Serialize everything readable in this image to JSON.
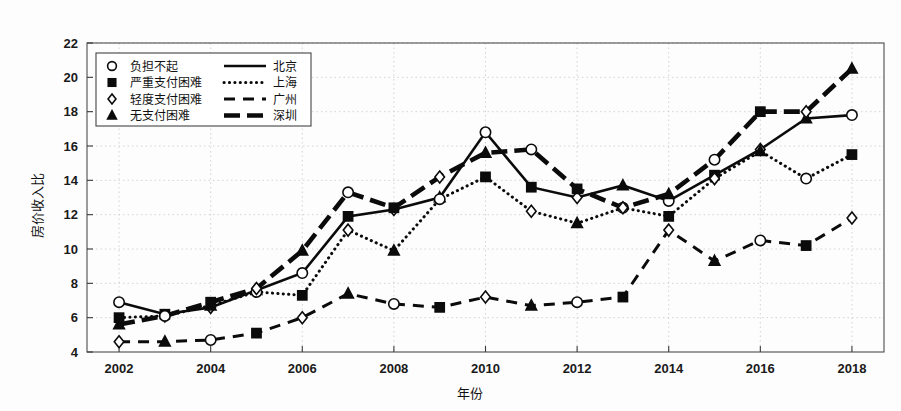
{
  "chart_data": {
    "type": "line",
    "title": "",
    "xlabel": "年份",
    "ylabel": "房价收入比",
    "xlim": [
      2001.3,
      2018.7
    ],
    "ylim": [
      4,
      22
    ],
    "ytick_labels": [
      "4",
      "6",
      "8",
      "10",
      "12",
      "14",
      "16",
      "18",
      "20",
      "22"
    ],
    "yticks": [
      4,
      6,
      8,
      10,
      12,
      14,
      16,
      18,
      20,
      22
    ],
    "xtick_labels": [
      "2002",
      "2004",
      "2006",
      "2008",
      "2010",
      "2012",
      "2014",
      "2016",
      "2018"
    ],
    "xticks": [
      2002,
      2004,
      2006,
      2008,
      2010,
      2012,
      2014,
      2016,
      2018
    ],
    "x": [
      2002,
      2003,
      2004,
      2005,
      2006,
      2007,
      2008,
      2009,
      2010,
      2011,
      2012,
      2013,
      2014,
      2015,
      2016,
      2017,
      2018
    ],
    "grid": true,
    "legend_position": "upper-left",
    "series": [
      {
        "name": "北京",
        "line_style": "solid",
        "color": "#0b0b0b",
        "values": [
          6.9,
          6.2,
          6.6,
          7.6,
          8.6,
          11.9,
          12.3,
          13.0,
          16.8,
          13.6,
          13.0,
          13.7,
          12.8,
          14.3,
          15.8,
          17.6,
          17.8
        ]
      },
      {
        "name": "上海",
        "line_style": "dotted",
        "color": "#0b0b0b",
        "values": [
          6.0,
          6.1,
          6.7,
          7.5,
          7.3,
          11.1,
          9.9,
          12.9,
          14.2,
          12.2,
          11.5,
          12.4,
          11.9,
          14.1,
          15.7,
          14.1,
          15.5
        ]
      },
      {
        "name": "广州",
        "line_style": "dashed",
        "color": "#0b0b0b",
        "values": [
          4.6,
          4.6,
          4.7,
          5.1,
          6.0,
          7.4,
          6.8,
          6.6,
          7.2,
          6.7,
          6.9,
          7.2,
          11.1,
          9.3,
          10.5,
          10.2,
          11.8
        ]
      },
      {
        "name": "深圳",
        "line_style": "thick",
        "color": "#0b0b0b",
        "values": [
          5.6,
          6.1,
          6.9,
          7.7,
          9.9,
          13.3,
          12.4,
          14.2,
          15.6,
          15.8,
          13.5,
          12.4,
          13.2,
          15.2,
          18.0,
          18.0,
          20.5
        ]
      }
    ],
    "markers_by_category": {
      "negative": "circle",
      "severe": "square",
      "mild": "diamond",
      "none": "triangle"
    }
  },
  "legend": {
    "marker_entries": [
      {
        "marker": "circle",
        "label": "负担不起"
      },
      {
        "marker": "square",
        "label": "严重支付困难"
      },
      {
        "marker": "diamond",
        "label": "轻度支付困难"
      },
      {
        "marker": "triangle",
        "label": "无支付困难"
      }
    ],
    "line_entries": [
      {
        "style": "solid",
        "label": "北京"
      },
      {
        "style": "dotted",
        "label": "上海"
      },
      {
        "style": "dashed",
        "label": "广州"
      },
      {
        "style": "thick",
        "label": "深圳"
      }
    ]
  }
}
